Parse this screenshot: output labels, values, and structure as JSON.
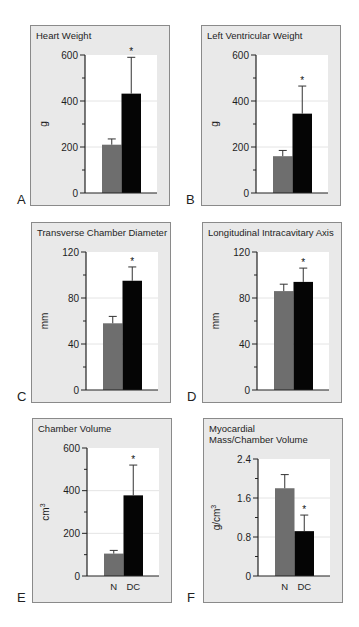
{
  "figure": {
    "groups": [
      "N",
      "DC"
    ],
    "colors": {
      "N": "#6e6e6e",
      "DC": "#050505",
      "panel_bg": "#e9e9e9",
      "plot_bg": "#ffffff"
    },
    "significance_marker": "*"
  },
  "chart_data": [
    {
      "panel": "A",
      "type": "bar",
      "title": "Heart Weight",
      "ylabel": "g",
      "categories": [
        "N",
        "DC"
      ],
      "values": [
        210,
        432
      ],
      "error_upper": [
        235,
        590
      ],
      "ylim": [
        0,
        600
      ],
      "yticks": [
        0,
        200,
        400,
        600
      ],
      "significant": [
        false,
        true
      ],
      "show_xlabels": false,
      "grid": true
    },
    {
      "panel": "B",
      "type": "bar",
      "title": "Left Ventricular Weight",
      "ylabel": "g",
      "categories": [
        "N",
        "DC"
      ],
      "values": [
        160,
        345
      ],
      "error_upper": [
        185,
        465
      ],
      "ylim": [
        0,
        600
      ],
      "yticks": [
        0,
        200,
        400,
        600
      ],
      "significant": [
        false,
        true
      ],
      "show_xlabels": false,
      "grid": true
    },
    {
      "panel": "C",
      "type": "bar",
      "title": "Transverse Chamber Diameter",
      "ylabel": "mm",
      "categories": [
        "N",
        "DC"
      ],
      "values": [
        58,
        95
      ],
      "error_upper": [
        64,
        107
      ],
      "ylim": [
        0,
        120
      ],
      "yticks": [
        0,
        40,
        80,
        120
      ],
      "significant": [
        false,
        true
      ],
      "show_xlabels": false,
      "grid": true
    },
    {
      "panel": "D",
      "type": "bar",
      "title": "Longitudinal Intracavitary Axis",
      "ylabel": "mm",
      "categories": [
        "N",
        "DC"
      ],
      "values": [
        86,
        94
      ],
      "error_upper": [
        92,
        106
      ],
      "ylim": [
        0,
        120
      ],
      "yticks": [
        0,
        40,
        80,
        120
      ],
      "significant": [
        false,
        true
      ],
      "show_xlabels": false,
      "grid": true
    },
    {
      "panel": "E",
      "type": "bar",
      "title": "Chamber Volume",
      "ylabel": "cm3",
      "categories": [
        "N",
        "DC"
      ],
      "values": [
        105,
        378
      ],
      "error_upper": [
        120,
        520
      ],
      "ylim": [
        0,
        600
      ],
      "yticks": [
        0,
        200,
        400,
        600
      ],
      "significant": [
        false,
        true
      ],
      "show_xlabels": true,
      "grid": true
    },
    {
      "panel": "F",
      "type": "bar",
      "title": "Myocardial\nMass/Chamber Volume",
      "ylabel": "g/cm3",
      "categories": [
        "N",
        "DC"
      ],
      "values": [
        1.8,
        0.92
      ],
      "error_upper": [
        2.08,
        1.25
      ],
      "ylim": [
        0,
        2.4
      ],
      "yticks": [
        0,
        0.8,
        1.6,
        2.4
      ],
      "significant": [
        false,
        true
      ],
      "show_xlabels": true,
      "grid": true
    }
  ]
}
